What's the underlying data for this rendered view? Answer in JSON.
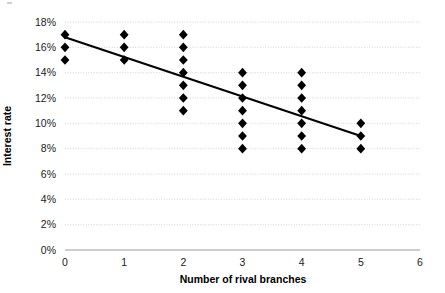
{
  "chart_data": {
    "type": "scatter",
    "title": "",
    "xlabel": "Number of rival branches",
    "ylabel": "Interest rate",
    "xlim": [
      0,
      6
    ],
    "ylim": [
      0,
      18
    ],
    "grid": true,
    "legend": "none",
    "x_ticks": [
      "0",
      "1",
      "2",
      "3",
      "4",
      "5",
      "6"
    ],
    "x_tick_values": [
      0,
      1,
      2,
      3,
      4,
      5,
      6
    ],
    "y_ticks": [
      "0%",
      "2%",
      "4%",
      "6%",
      "8%",
      "10%",
      "12%",
      "14%",
      "16%",
      "18%"
    ],
    "y_tick_values": [
      0,
      2,
      4,
      6,
      8,
      10,
      12,
      14,
      16,
      18
    ],
    "marker_shape": "diamond",
    "marker_color": "#000000",
    "point_count": 30,
    "points": [
      {
        "x": 0,
        "y": 17
      },
      {
        "x": 0,
        "y": 16
      },
      {
        "x": 0,
        "y": 15
      },
      {
        "x": 1,
        "y": 17
      },
      {
        "x": 1,
        "y": 16
      },
      {
        "x": 1,
        "y": 15
      },
      {
        "x": 2,
        "y": 17
      },
      {
        "x": 2,
        "y": 16
      },
      {
        "x": 2,
        "y": 15
      },
      {
        "x": 2,
        "y": 14
      },
      {
        "x": 2,
        "y": 13
      },
      {
        "x": 2,
        "y": 12
      },
      {
        "x": 2,
        "y": 11
      },
      {
        "x": 3,
        "y": 14
      },
      {
        "x": 3,
        "y": 13
      },
      {
        "x": 3,
        "y": 12
      },
      {
        "x": 3,
        "y": 11
      },
      {
        "x": 3,
        "y": 10
      },
      {
        "x": 3,
        "y": 9
      },
      {
        "x": 3,
        "y": 8
      },
      {
        "x": 4,
        "y": 14
      },
      {
        "x": 4,
        "y": 13
      },
      {
        "x": 4,
        "y": 12
      },
      {
        "x": 4,
        "y": 11
      },
      {
        "x": 4,
        "y": 10
      },
      {
        "x": 4,
        "y": 9
      },
      {
        "x": 4,
        "y": 8
      },
      {
        "x": 5,
        "y": 10
      },
      {
        "x": 5,
        "y": 9
      },
      {
        "x": 5,
        "y": 8
      }
    ],
    "trendline": {
      "type": "linear",
      "color": "#000000",
      "x_start": 0,
      "y_start": 16.8,
      "x_end": 5,
      "y_end": 9.0
    }
  }
}
